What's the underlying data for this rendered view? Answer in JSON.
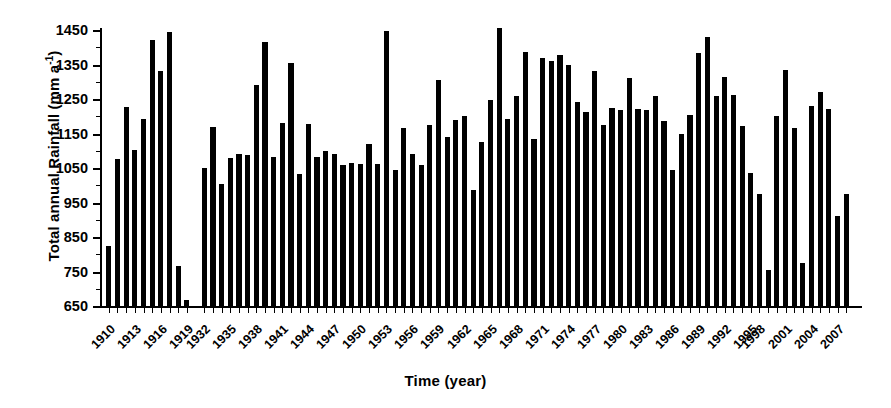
{
  "chart_data": {
    "type": "bar",
    "title": "",
    "xlabel": "Time (year)",
    "ylabel": "Total annual Rainfall (mm a-1)",
    "ylabel_base": "Total annual Rainfall (mm a",
    "ylabel_sup": "-1",
    "ylabel_tail": ")",
    "ylim": [
      650,
      1450
    ],
    "ytick_step": 100,
    "yticks": [
      650,
      750,
      850,
      950,
      1050,
      1150,
      1250,
      1350,
      1450
    ],
    "ytick_labels": [
      "650",
      "750",
      "850",
      "950",
      "1050",
      "1150",
      "1250",
      "1350",
      "1450"
    ],
    "grid": false,
    "legend": null,
    "bar_color": "#000000",
    "xlabel_step": 3,
    "xtick_labels": [
      "1910",
      "1913",
      "1916",
      "1919",
      "1932",
      "1935",
      "1938",
      "1941",
      "1944",
      "1947",
      "1950",
      "1953",
      "1956",
      "1959",
      "1962",
      "1965",
      "1968",
      "1971",
      "1974",
      "1977",
      "1980",
      "1983",
      "1986",
      "1989",
      "1992",
      "1995",
      "1998",
      "2001",
      "2004",
      "2007"
    ],
    "data_gaps": [
      "1921-1931",
      "1996-1997"
    ],
    "categories": [
      "1910",
      "1911",
      "1912",
      "1913",
      "1914",
      "1915",
      "1916",
      "1917",
      "1918",
      "1919",
      "1920",
      "1932",
      "1933",
      "1934",
      "1935",
      "1936",
      "1937",
      "1938",
      "1939",
      "1940",
      "1941",
      "1942",
      "1943",
      "1944",
      "1945",
      "1946",
      "1947",
      "1948",
      "1949",
      "1950",
      "1951",
      "1952",
      "1953",
      "1954",
      "1955",
      "1956",
      "1957",
      "1958",
      "1959",
      "1960",
      "1961",
      "1962",
      "1963",
      "1964",
      "1965",
      "1966",
      "1967",
      "1968",
      "1969",
      "1970",
      "1971",
      "1972",
      "1973",
      "1974",
      "1975",
      "1976",
      "1977",
      "1978",
      "1979",
      "1980",
      "1981",
      "1982",
      "1983",
      "1984",
      "1985",
      "1986",
      "1987",
      "1988",
      "1989",
      "1990",
      "1991",
      "1992",
      "1993",
      "1994",
      "1995",
      "1998",
      "1999",
      "2000",
      "2001",
      "2002",
      "2003",
      "2004",
      "2005",
      "2006",
      "2007",
      "2008"
    ],
    "values": [
      825,
      1075,
      1228,
      1103,
      1192,
      1420,
      1330,
      1445,
      765,
      668,
      null,
      1050,
      1168,
      1005,
      1080,
      1090,
      1088,
      1290,
      1415,
      1082,
      1180,
      1355,
      1032,
      1178,
      1082,
      1098,
      1090,
      1060,
      1065,
      1062,
      1120,
      1062,
      1448,
      1045,
      1165,
      1090,
      1060,
      1175,
      1305,
      1140,
      1190,
      1200,
      985,
      1125,
      1248,
      1455,
      1192,
      1260,
      1385,
      1133,
      1370,
      1360,
      1378,
      1350,
      1240,
      1212,
      1330,
      1175,
      1225,
      1218,
      1310,
      1220,
      1218,
      1258,
      1185,
      1045,
      1150,
      1205,
      1382,
      1430,
      1258,
      1315,
      1262,
      1172,
      1035,
      975,
      755,
      1200,
      1335,
      1165,
      775,
      1230,
      1270,
      1222,
      910,
      975
    ]
  }
}
